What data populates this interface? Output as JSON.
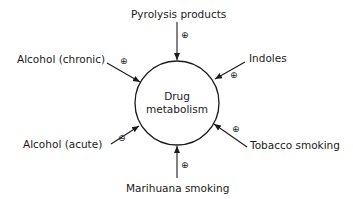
{
  "diagram": {
    "center": {
      "line1": "Drug",
      "line2": "metabolism"
    },
    "factors": [
      {
        "label": "Pyrolysis products",
        "effect": "⊕"
      },
      {
        "label": "Indoles",
        "effect": "⊕"
      },
      {
        "label": "Tobacco smoking",
        "effect": "⊕"
      },
      {
        "label": "Marihuana smoking",
        "effect": "⊕"
      },
      {
        "label": "Alcohol (acute)",
        "effect": "⊖"
      },
      {
        "label": "Alcohol (chronic)",
        "effect": "⊕"
      }
    ]
  }
}
